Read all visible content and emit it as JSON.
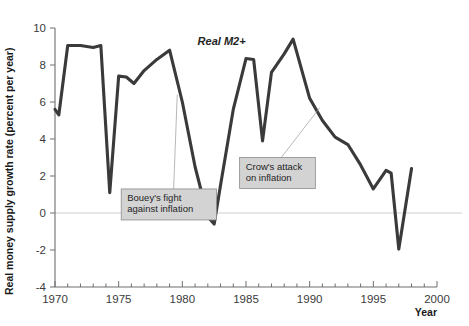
{
  "chart_data": {
    "type": "line",
    "title": "",
    "xlabel": "Year",
    "ylabel": "Real money supply growth rate (percent per year)",
    "xlim": [
      1970,
      2000
    ],
    "ylim": [
      -4,
      10
    ],
    "grid": false,
    "zero_line": true,
    "legend_position": "inline-label",
    "x_ticks_major": [
      1970,
      1975,
      1980,
      1985,
      1990,
      1995,
      2000
    ],
    "x_ticks_minor_step": 1,
    "y_ticks": [
      -4,
      -2,
      0,
      2,
      4,
      6,
      8,
      10
    ],
    "series": [
      {
        "name": "Real M2+",
        "color": "#3a3a3a",
        "x": [
          1970.0,
          1970.3,
          1971.0,
          1972.0,
          1973.0,
          1973.6,
          1974.3,
          1975.0,
          1975.6,
          1976.2,
          1977.0,
          1978.0,
          1979.0,
          1980.0,
          1981.0,
          1982.0,
          1982.5,
          1983.0,
          1984.0,
          1985.0,
          1985.6,
          1986.3,
          1987.0,
          1988.0,
          1988.7,
          1990.0,
          1991.0,
          1992.0,
          1993.0,
          1994.0,
          1995.0,
          1996.0,
          1996.4,
          1997.0,
          1998.0
        ],
        "y": [
          5.6,
          5.3,
          9.05,
          9.05,
          8.95,
          9.05,
          1.1,
          7.4,
          7.35,
          7.0,
          7.7,
          8.3,
          8.8,
          6.0,
          2.5,
          -0.2,
          -0.6,
          1.5,
          5.6,
          8.35,
          8.3,
          3.9,
          7.6,
          8.6,
          9.4,
          6.2,
          5.0,
          4.1,
          3.7,
          2.6,
          1.3,
          2.3,
          2.15,
          -1.95,
          2.4
        ]
      }
    ],
    "annotations": [
      {
        "id": "bouey",
        "text_lines": [
          "Bouey's fight",
          "against inflation"
        ],
        "box_x": 1975.2,
        "box_y": 1.3,
        "target_x": 1979.6,
        "target_y": 6.4
      },
      {
        "id": "crow",
        "text_lines": [
          "Crow's attack",
          "on inflation"
        ],
        "box_x": 1984.5,
        "box_y": 3.0,
        "target_x": 1990.8,
        "target_y": 5.7
      }
    ],
    "series_label": {
      "text": "Real M2+",
      "x": 1981.2,
      "y": 9.1
    }
  },
  "axes": {
    "y_title": "Real money supply growth rate (percent per year)",
    "x_title": "Year",
    "y_tick_labels": [
      "10",
      "8",
      "6",
      "4",
      "2",
      "0",
      "-2",
      "-4"
    ],
    "x_tick_labels": [
      "1970",
      "1975",
      "1980",
      "1985",
      "1990",
      "1995",
      "2000"
    ]
  },
  "colors": {
    "line": "#3a3a3a",
    "annotation_box_fill": "#d3d3d3",
    "annotation_box_stroke": "#8a8a8a",
    "axis": "#6e6e6e",
    "zero_line": "#cfcfcf",
    "background": "#ffffff"
  }
}
